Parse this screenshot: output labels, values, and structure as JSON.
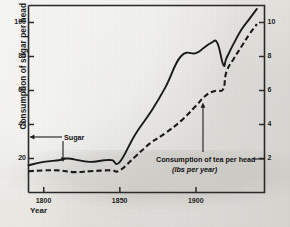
{
  "chart_data": {
    "type": "line",
    "title": "",
    "xlabel": "Year",
    "ylabel": "Consumption of sugar per head (lbs per year)",
    "ylabel_right": "Consumption of tea per head (lbs per year)",
    "xlim": [
      1790,
      1945
    ],
    "ylim": [
      0,
      110
    ],
    "ylim_right": [
      0,
      11
    ],
    "grid": false,
    "legend_position": "inline-annotations",
    "xticks": [
      1800,
      1850,
      1900
    ],
    "xtick_labels": [
      "1800",
      "1850",
      "1900"
    ],
    "yticks": [
      20,
      40,
      60,
      80,
      100
    ],
    "ytick_labels": [
      "20",
      "40",
      "60",
      "80",
      "100"
    ],
    "yticks_right": [
      2,
      4,
      6,
      8,
      10
    ],
    "ytick_labels_right": [
      "2",
      "4",
      "6",
      "8",
      "10"
    ],
    "annotations": [
      {
        "text": "Sugar",
        "points_to": "sugar-series"
      },
      {
        "text": "Consumption of tea per head",
        "points_to": "tea-series"
      },
      {
        "text": "(lbs per year)",
        "points_to": "tea-series"
      }
    ],
    "series": [
      {
        "name": "Sugar",
        "axis": "left",
        "style": "solid",
        "units": "lbs per head per year",
        "x": [
          1790,
          1800,
          1810,
          1815,
          1820,
          1830,
          1840,
          1845,
          1850,
          1860,
          1870,
          1880,
          1890,
          1900,
          1905,
          1910,
          1914,
          1918,
          1920,
          1925,
          1930,
          1935,
          1940
        ],
        "values": [
          16,
          18,
          19,
          20,
          19.5,
          18,
          19,
          19,
          18,
          34,
          47,
          62,
          80,
          82,
          85,
          88,
          88,
          75,
          79,
          88,
          96,
          102,
          108
        ]
      },
      {
        "name": "Consumption of tea per head",
        "axis": "right",
        "style": "dashed",
        "units": "lbs per head per year",
        "x": [
          1790,
          1800,
          1810,
          1820,
          1830,
          1840,
          1845,
          1850,
          1860,
          1870,
          1880,
          1890,
          1900,
          1905,
          1910,
          1914,
          1918,
          1920,
          1925,
          1930,
          1935,
          1940
        ],
        "values": [
          1.25,
          1.3,
          1.3,
          1.2,
          1.25,
          1.3,
          1.3,
          1.3,
          2.1,
          2.9,
          3.5,
          4.2,
          5.1,
          5.6,
          5.9,
          6.0,
          6.1,
          7.1,
          7.9,
          8.6,
          9.3,
          9.9
        ]
      }
    ]
  },
  "axes": {
    "ylabel": "Consumption of sugar per head (lbs per year)",
    "xlabel": "Year"
  },
  "annotations": {
    "sugar": "Sugar",
    "tea_line1": "Consumption of tea per head",
    "tea_line2": "(lbs per year)"
  },
  "colors": {
    "ink": "#1b1b1b",
    "paper": "#e9e8e4"
  }
}
